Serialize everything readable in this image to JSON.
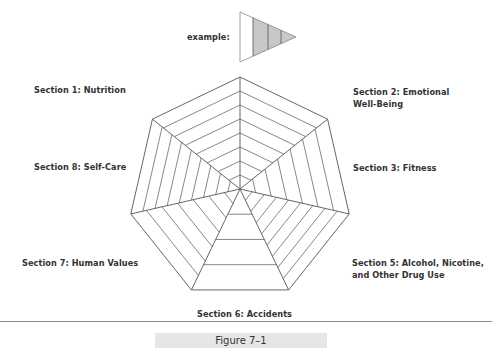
{
  "example": {
    "label": "example:"
  },
  "sections": [
    {
      "id": 1,
      "label_lines": [
        "Section 1: Nutrition"
      ]
    },
    {
      "id": 2,
      "label_lines": [
        "Section 2: Emotional",
        "Well-Being"
      ]
    },
    {
      "id": 3,
      "label_lines": [
        "Section 3: Fitness"
      ]
    },
    {
      "id": 5,
      "label_lines": [
        "Section 5: Alcohol, Nicotine,",
        "and Other Drug Use"
      ]
    },
    {
      "id": 6,
      "label_lines": [
        "Section 6: Accidents"
      ]
    },
    {
      "id": 7,
      "label_lines": [
        "Section 7: Human Values"
      ]
    },
    {
      "id": 8,
      "label_lines": [
        "Section 8: Self-Care"
      ]
    }
  ],
  "labels": {
    "s1": "Section 1: Nutrition",
    "s2a": "Section 2: Emotional",
    "s2b": "Well-Being",
    "s3": "Section 3: Fitness",
    "s5a": "Section 5: Alcohol, Nicotine,",
    "s5b": "and Other Drug Use",
    "s6": "Section 6: Accidents",
    "s7": "Section 7: Human Values",
    "s8": "Section 8: Self-Care"
  },
  "wedge_divisions": {
    "top_left": 8,
    "top_right": 8,
    "right": 7,
    "lower_right": 9,
    "bottom": 4,
    "lower_left": 7,
    "left": 9
  },
  "colors": {
    "line": "#555555",
    "example_shade": "#c8c8c8",
    "caption_bg": "#e6e6e6"
  },
  "caption": "Figure 7–1"
}
